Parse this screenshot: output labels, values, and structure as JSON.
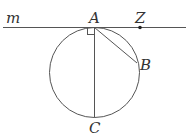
{
  "diagram": {
    "labels": {
      "line": "m",
      "A": "A",
      "Z": "Z",
      "B": "B",
      "C": "C"
    },
    "stroke_color": "#555555",
    "point_color": "#222222"
  }
}
